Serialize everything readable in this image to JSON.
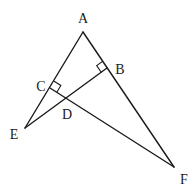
{
  "diagram": {
    "type": "geometry",
    "points": {
      "A": {
        "label": "A",
        "x": 83,
        "y": 32,
        "lx": 83,
        "ly": 23
      },
      "B": {
        "label": "B",
        "x": 107,
        "y": 68,
        "lx": 120,
        "ly": 73
      },
      "C": {
        "label": "C",
        "x": 50,
        "y": 88,
        "lx": 40,
        "ly": 90
      },
      "D": {
        "label": "D",
        "x": 67,
        "y": 99,
        "lx": 67,
        "ly": 119
      },
      "E": {
        "label": "E",
        "x": 25,
        "y": 128,
        "lx": 14,
        "ly": 138
      },
      "F": {
        "label": "F",
        "x": 174,
        "y": 167,
        "lx": 184,
        "ly": 183
      }
    },
    "segments": [
      {
        "from": "A",
        "to": "E"
      },
      {
        "from": "A",
        "to": "F"
      },
      {
        "from": "E",
        "to": "B"
      },
      {
        "from": "C",
        "to": "F"
      }
    ],
    "right_angles": [
      {
        "at": "B",
        "description": "EB perpendicular to AF"
      },
      {
        "at": "C",
        "description": "CF perpendicular to AE"
      }
    ],
    "colors": {
      "stroke": "#1a1a1a",
      "background": "#ffffff"
    }
  }
}
